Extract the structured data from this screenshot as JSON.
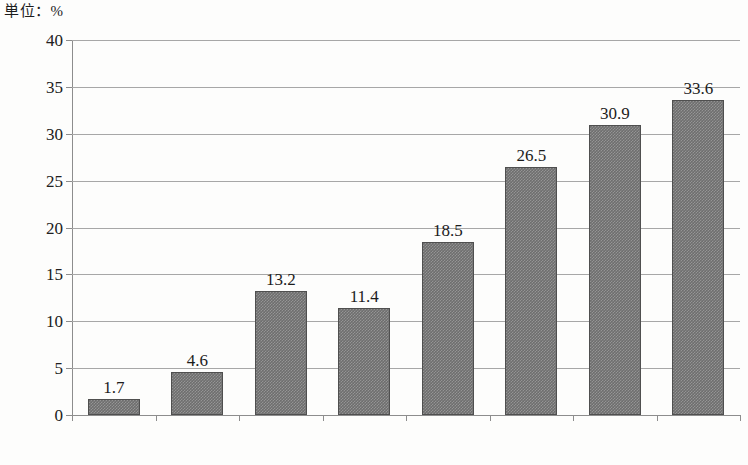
{
  "unit_caption": "単位：%",
  "chart_data": {
    "type": "bar",
    "title": "",
    "subtitle": "",
    "xlabel": "",
    "ylabel": "",
    "unit": "%",
    "unit_label": "単位：%",
    "categories": [
      "1998",
      "1999",
      "2000",
      "2001",
      "2002",
      "2003",
      "2004",
      "2005"
    ],
    "values": [
      1.7,
      4.6,
      13.2,
      11.4,
      18.5,
      26.5,
      30.9,
      33.6
    ],
    "value_labels": [
      "1.7",
      "4.6",
      "13.2",
      "11.4",
      "18.5",
      "26.5",
      "30.9",
      "33.6"
    ],
    "ylim": [
      0,
      40
    ],
    "ytick_values": [
      0,
      5,
      10,
      15,
      20,
      25,
      30,
      35,
      40
    ],
    "ytick_labels": [
      "0",
      "5",
      "10",
      "15",
      "20",
      "25",
      "30",
      "35",
      "40"
    ],
    "grid": true,
    "grid_axis": "y",
    "legend": false,
    "legend_position": "none",
    "series": [
      {
        "name": "",
        "values": [
          1.7,
          4.6,
          13.2,
          11.4,
          18.5,
          26.5,
          30.9,
          33.6
        ],
        "color": "#6e6e6e"
      }
    ],
    "colors": {
      "bar_fill": "#6e6e6e",
      "bar_edge": "#4f4f4f",
      "gridline": "#a7a7a7",
      "axis": "#8d8d8d",
      "text": "#1c1c1c",
      "background": "#fdfdfc"
    }
  }
}
